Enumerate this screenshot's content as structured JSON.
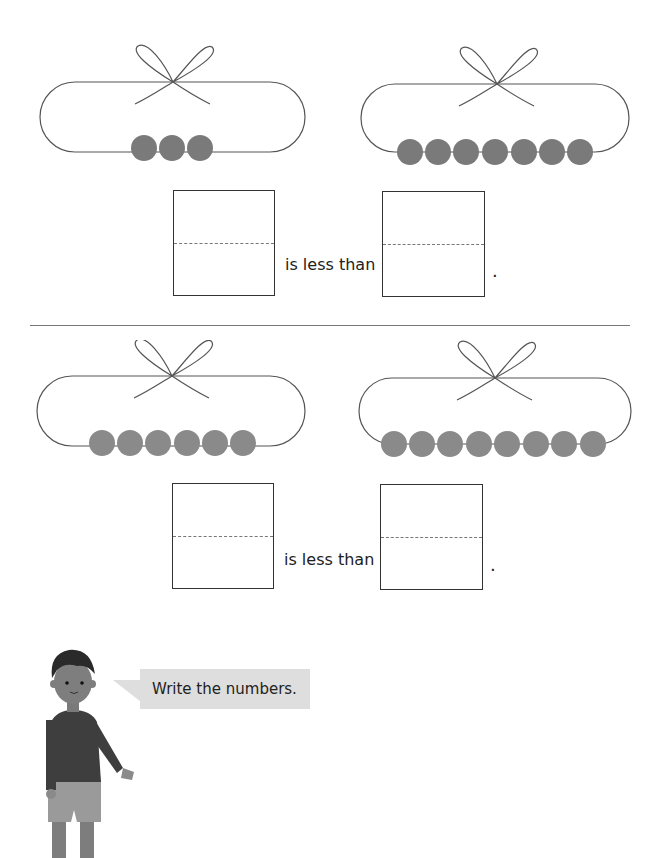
{
  "exercise": {
    "instruction": "Write the numbers.",
    "comparisons": [
      {
        "left_bead_count": 3,
        "right_bead_count": 7,
        "phrase": "is less than",
        "end_punctuation": "."
      },
      {
        "left_bead_count": 6,
        "right_bead_count": 8,
        "phrase": "is less than",
        "end_punctuation": "."
      }
    ]
  },
  "colors": {
    "bead": "#7a7a7a",
    "string": "#555555",
    "bubble": "#dedede"
  },
  "icons": {
    "bow": "bow-string-icon",
    "character": "boy-character-illustration"
  }
}
